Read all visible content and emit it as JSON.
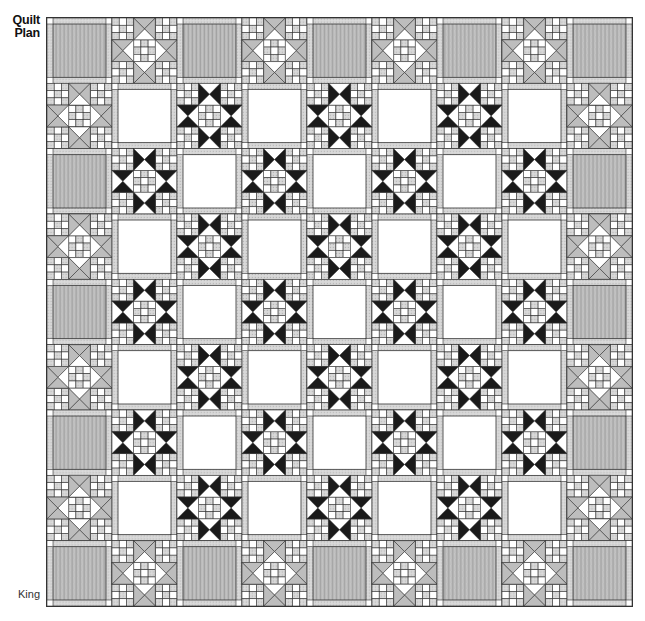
{
  "title": {
    "line1": "Quilt",
    "line2": "Plan"
  },
  "size_label": "King",
  "quilt": {
    "rows": 9,
    "cols": 9,
    "legend": {
      "G": "gray-fabric-block",
      "X": "border-star-block-x",
      "S": "ohio-star-block",
      "W": "white-plain-block"
    },
    "layout": [
      [
        "G",
        "X",
        "G",
        "X",
        "G",
        "X",
        "G",
        "X",
        "G"
      ],
      [
        "X",
        "W",
        "S",
        "W",
        "S",
        "W",
        "S",
        "W",
        "X"
      ],
      [
        "G",
        "S",
        "W",
        "S",
        "W",
        "S",
        "W",
        "S",
        "G"
      ],
      [
        "X",
        "W",
        "S",
        "W",
        "S",
        "W",
        "S",
        "W",
        "X"
      ],
      [
        "G",
        "S",
        "W",
        "S",
        "W",
        "S",
        "W",
        "S",
        "G"
      ],
      [
        "X",
        "W",
        "S",
        "W",
        "S",
        "W",
        "S",
        "W",
        "X"
      ],
      [
        "G",
        "S",
        "W",
        "S",
        "W",
        "S",
        "W",
        "S",
        "G"
      ],
      [
        "X",
        "W",
        "S",
        "W",
        "S",
        "W",
        "S",
        "W",
        "X"
      ],
      [
        "G",
        "X",
        "G",
        "X",
        "G",
        "X",
        "G",
        "X",
        "G"
      ]
    ],
    "colors": {
      "outline": "#333333",
      "gray_fabric": "#b9b9b9",
      "gray_fabric_dark": "#9a9a9a",
      "light_check": "#d6d6d6",
      "white": "#ffffff",
      "black": "#1a1a1a",
      "x_triangle": "#bdbdbd"
    }
  }
}
